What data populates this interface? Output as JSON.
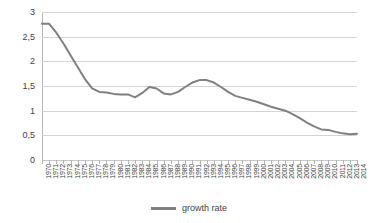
{
  "chart_data": {
    "type": "line",
    "title": "",
    "xlabel": "",
    "ylabel": "",
    "ylim": [
      0,
      3
    ],
    "ytick_labels": [
      "0",
      "0,5",
      "1",
      "1,5",
      "2",
      "2,5",
      "3"
    ],
    "ytick_values": [
      0,
      0.5,
      1,
      1.5,
      2,
      2.5,
      3
    ],
    "grid": true,
    "legend_position": "bottom",
    "decimal_separator": ",",
    "categories": [
      "1970",
      "1971",
      "1972",
      "1973",
      "1974",
      "1975",
      "1976",
      "1977",
      "1978",
      "1979",
      "1980",
      "1981",
      "1982",
      "1983",
      "1984",
      "1985",
      "1986",
      "1987",
      "1988",
      "1989",
      "1990",
      "1991",
      "1992",
      "1993",
      "1994",
      "1995",
      "1996",
      "1997",
      "1998",
      "1999",
      "2000",
      "2001",
      "2002",
      "2003",
      "2004",
      "2005",
      "2006",
      "2007",
      "2008",
      "2009",
      "2010",
      "2011",
      "2012",
      "2013",
      "2014"
    ],
    "series": [
      {
        "name": "growth rate",
        "color": "#808080",
        "values": [
          2.76,
          2.76,
          2.58,
          2.36,
          2.12,
          1.88,
          1.64,
          1.45,
          1.38,
          1.37,
          1.34,
          1.33,
          1.33,
          1.27,
          1.36,
          1.48,
          1.45,
          1.35,
          1.33,
          1.38,
          1.48,
          1.57,
          1.62,
          1.62,
          1.57,
          1.48,
          1.38,
          1.3,
          1.26,
          1.22,
          1.18,
          1.13,
          1.08,
          1.04,
          1.0,
          0.93,
          0.85,
          0.76,
          0.68,
          0.62,
          0.61,
          0.57,
          0.54,
          0.52,
          0.53
        ]
      }
    ]
  },
  "legend": {
    "items": [
      {
        "label": "growth rate",
        "color": "#808080"
      }
    ]
  },
  "colors": {
    "series_line": "#808080",
    "gridline": "#d4d4d4",
    "axis": "#b5b5b5",
    "text": "#3f3f3f",
    "background": "#ffffff"
  }
}
